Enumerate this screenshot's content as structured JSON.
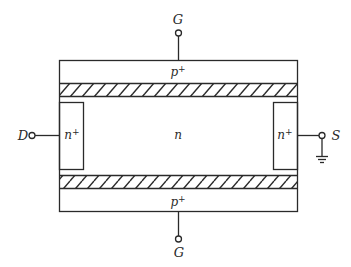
{
  "diagram": {
    "colors": {
      "stroke": "#2a2a2a",
      "background": "#ffffff"
    },
    "terminals": {
      "gate_top": {
        "label": "G"
      },
      "gate_bottom": {
        "label": "G"
      },
      "drain": {
        "label": "D"
      },
      "source": {
        "label": "S"
      }
    },
    "regions": {
      "top_gate": {
        "label": "p+",
        "base": "p",
        "sup": "+"
      },
      "bottom_gate": {
        "label": "p+",
        "base": "p",
        "sup": "+"
      },
      "channel": {
        "label": "n"
      },
      "drain_contact": {
        "label": "n+",
        "base": "n",
        "sup": "+"
      },
      "source_contact": {
        "label": "n+",
        "base": "n",
        "sup": "+"
      }
    },
    "symbols": {
      "ground": "ground-icon",
      "terminal": "terminal-circle-icon",
      "depletion": "hatched-depletion-region"
    }
  }
}
